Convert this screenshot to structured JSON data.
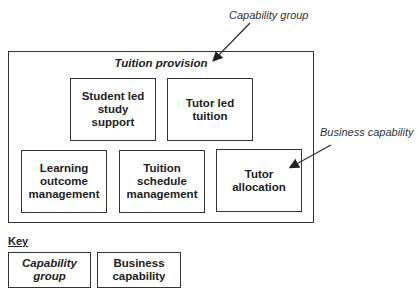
{
  "callouts": {
    "capability_group": "Capability group",
    "business_capability": "Business capability"
  },
  "group": {
    "title": "Tuition provision",
    "capabilities": [
      {
        "label": "Student led study support"
      },
      {
        "label": "Tutor led tuition"
      },
      {
        "label": "Learning outcome management"
      },
      {
        "label": "Tuition schedule management"
      },
      {
        "label": "Tutor allocation"
      }
    ]
  },
  "key": {
    "title": "Key",
    "items": [
      {
        "label": "Capability group",
        "style": "italic"
      },
      {
        "label": "Business capability",
        "style": "bold"
      }
    ]
  }
}
